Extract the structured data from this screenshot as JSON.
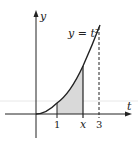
{
  "diagram": {
    "axes": {
      "x_label": "t",
      "y_label": "y"
    },
    "curve_label": "y = t²",
    "ticks": [
      {
        "label": "1",
        "t": 1
      },
      {
        "label": "x",
        "t": 2.2
      },
      {
        "label": "3",
        "t": 3
      }
    ],
    "shaded_region": {
      "from": "1",
      "to": "x",
      "color": "#d9d9d9"
    },
    "dashed_line_at": "3",
    "colors": {
      "line": "#222222",
      "shade": "#d9d9d9",
      "guide": "#e6e6e6"
    }
  }
}
